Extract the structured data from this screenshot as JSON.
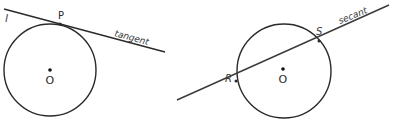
{
  "figure_left": {
    "line_label": "l",
    "point_label": "P",
    "center_label": "O",
    "line_type_label": "tangent"
  },
  "figure_right": {
    "point1_label": "R",
    "point2_label": "S",
    "center_label": "O",
    "line_type_label": "secant"
  },
  "colors": {
    "stroke": "#2a2a2a",
    "background": "#ffffff"
  }
}
